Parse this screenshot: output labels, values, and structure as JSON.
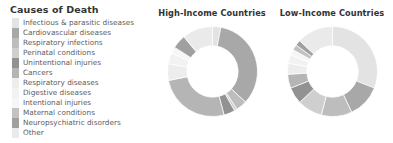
{
  "legend": {
    "title": "Causes of Death",
    "items": [
      {
        "label": "Infectious & parasitic diseases",
        "color": "#e3e3e3"
      },
      {
        "label": "Cardiovascular diseases",
        "color": "#a8a8a8"
      },
      {
        "label": "Respiratory infections",
        "color": "#bdbdbd"
      },
      {
        "label": "Perinatal conditions",
        "color": "#cfcfcf"
      },
      {
        "label": "Unintentional injuries",
        "color": "#929292"
      },
      {
        "label": "Cancers",
        "color": "#b5b5b5"
      },
      {
        "label": "Respiratory diseases",
        "color": "#ededed"
      },
      {
        "label": "Digestive diseases",
        "color": "#f2f2f2"
      },
      {
        "label": "Intentional injuries",
        "color": "#f6f6f6"
      },
      {
        "label": "Maternal conditions",
        "color": "#c2c2c2"
      },
      {
        "label": "Neuropsychiatric disorders",
        "color": "#a0a0a0"
      },
      {
        "label": "Other",
        "color": "#eaeaea"
      }
    ]
  },
  "charts": [
    {
      "id": "high",
      "title": "High-Income Countries"
    },
    {
      "id": "low",
      "title": "Low-Income Countries"
    }
  ],
  "chart_data": [
    {
      "type": "pie",
      "title": "High-Income Countries",
      "donut": true,
      "inner_radius_ratio": 0.57,
      "legend_position": "left",
      "categories": [
        "Infectious & parasitic diseases",
        "Cardiovascular diseases",
        "Respiratory infections",
        "Perinatal conditions",
        "Unintentional injuries",
        "Cancers",
        "Respiratory diseases",
        "Digestive diseases",
        "Intentional injuries",
        "Maternal conditions",
        "Neuropsychiatric disorders",
        "Other"
      ],
      "values": [
        3,
        34,
        4,
        1,
        4,
        26,
        6,
        4,
        2,
        0.3,
        5,
        11
      ],
      "colors": [
        "#e3e3e3",
        "#a8a8a8",
        "#bdbdbd",
        "#cfcfcf",
        "#929292",
        "#b5b5b5",
        "#ededed",
        "#f2f2f2",
        "#f6f6f6",
        "#c2c2c2",
        "#a0a0a0",
        "#eaeaea"
      ],
      "unit": "percent"
    },
    {
      "type": "pie",
      "title": "Low-Income Countries",
      "donut": true,
      "inner_radius_ratio": 0.57,
      "legend_position": "left",
      "categories": [
        "Infectious & parasitic diseases",
        "Cardiovascular diseases",
        "Respiratory infections",
        "Perinatal conditions",
        "Unintentional injuries",
        "Cancers",
        "Respiratory diseases",
        "Digestive diseases",
        "Intentional injuries",
        "Maternal conditions",
        "Neuropsychiatric disorders",
        "Other"
      ],
      "values": [
        31,
        12,
        11,
        9,
        6,
        5,
        4,
        3,
        2,
        2,
        2,
        13
      ],
      "colors": [
        "#e3e3e3",
        "#a8a8a8",
        "#bdbdbd",
        "#cfcfcf",
        "#929292",
        "#b5b5b5",
        "#ededed",
        "#f2f2f2",
        "#f6f6f6",
        "#c2c2c2",
        "#a0a0a0",
        "#eaeaea"
      ],
      "unit": "percent"
    }
  ]
}
